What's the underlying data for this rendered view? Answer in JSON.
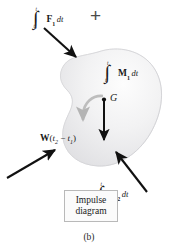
{
  "figure": {
    "caption": "(b)",
    "box_label_line1": "Impulse",
    "box_label_line2": "diagram",
    "plus": "+",
    "center_of_mass_label": "G",
    "background_color": "#ffffff",
    "body_fill_light": "#fbfbfb",
    "body_fill_dark": "#e2e2e4",
    "arrow_color": "#111111",
    "moment_arrow_color": "#b8b8b8",
    "box_border_color": "#b9b9b9"
  },
  "terms": {
    "f1": {
      "integral": "∫",
      "lower_limit": "t₁",
      "upper_limit": "t₂",
      "vector": "F",
      "subscript": "1",
      "differential": "dt",
      "full_text": "∫(t₁ to t₂) F₁ dt"
    },
    "m1": {
      "integral": "∫",
      "lower_limit": "t₁",
      "upper_limit": "t₂",
      "vector": "M",
      "subscript": "1",
      "differential": "dt",
      "full_text": "∫(t₁ to t₂) M₁ dt"
    },
    "f2": {
      "integral": "∫",
      "lower_limit": "t₁",
      "upper_limit": "t₂",
      "vector": "F",
      "subscript": "2",
      "differential": "dt",
      "full_text": "∫(t₁ to t₂) F₂ dt"
    },
    "f3": {
      "integral": "∫",
      "lower_limit": "t₁",
      "upper_limit": "t₂",
      "vector": "F",
      "subscript": "3",
      "differential": "dt",
      "full_text": "∫(t₁ to t₂) F₃ dt"
    },
    "weight": {
      "vector": "W",
      "open_paren": "(",
      "t2": "t",
      "t2_sub": "2",
      "minus": " − ",
      "t1": "t",
      "t1_sub": "1",
      "close_paren": ")",
      "full_text": "W(t₂ − t₁)"
    }
  },
  "limits": {
    "t_lower_base": "t",
    "t_lower_sub": "1",
    "t_upper_base": "t",
    "t_upper_sub": "2"
  }
}
